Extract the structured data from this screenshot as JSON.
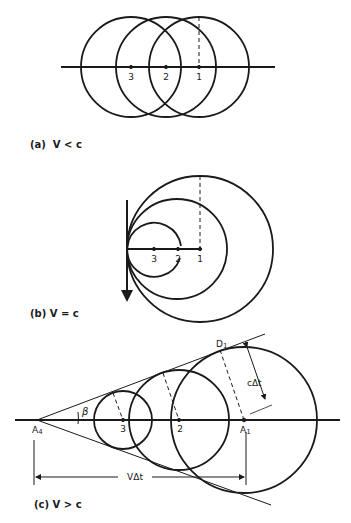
{
  "panels": {
    "a": {
      "caption": "(a)  V < c",
      "points": [
        "3",
        "2",
        "1"
      ]
    },
    "b": {
      "caption": "(b)  V = c",
      "points": [
        "3",
        "2",
        "1"
      ]
    },
    "c": {
      "caption": "(c)  V > c",
      "points": [
        "3",
        "2"
      ],
      "apex_label": "A",
      "apex_sub": "4",
      "source_label": "A",
      "source_sub": "1",
      "tangent_label": "D",
      "tangent_sub": "1",
      "angle_label": "β",
      "radius_dim_label": "cΔt",
      "travel_dim_label": "VΔt"
    }
  },
  "colors": {
    "ink": "#1a1a1a",
    "background": "#ffffff"
  }
}
